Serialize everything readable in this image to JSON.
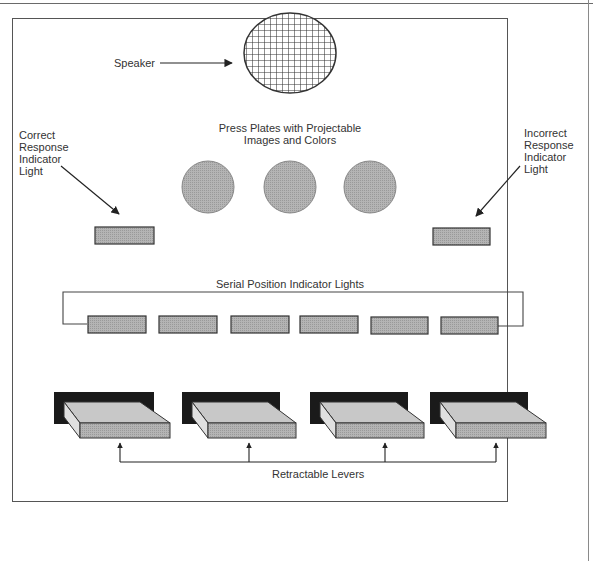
{
  "diagram": {
    "labels": {
      "speaker": "Speaker",
      "press_plates": [
        "Press Plates with Projectable",
        "Images and Colors"
      ],
      "correct_light": [
        "Correct",
        "Response",
        "Indicator",
        "Light"
      ],
      "incorrect_light": [
        "Incorrect",
        "Response",
        "Indicator",
        "Light"
      ],
      "serial_lights": "Serial Position Indicator Lights",
      "levers": "Retractable Levers"
    },
    "components": {
      "speaker": {
        "icon": "speaker-grille-icon",
        "count": 1
      },
      "press_plates": {
        "count": 3
      },
      "response_lights": {
        "count": 2
      },
      "serial_position_lights": {
        "count": 6
      },
      "levers": {
        "count": 4
      }
    },
    "colors": {
      "outline": "#333333",
      "fill_gray": "#a8a8a8",
      "lever_top": "#c8c8c8",
      "lever_side": "#e0e0e0",
      "lever_back": "#1a1a1a"
    }
  }
}
